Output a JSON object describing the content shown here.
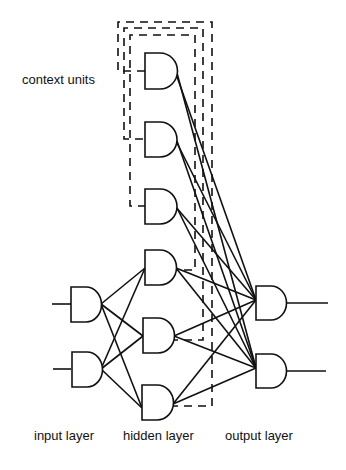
{
  "labels": {
    "context": "context units",
    "input": "input layer",
    "hidden": "hidden layer",
    "output": "output layer"
  },
  "diagram": {
    "type": "recurrent neural network (Elman network)",
    "node_shape": "AND-gate glyph",
    "layers": {
      "input": {
        "count": 2
      },
      "hidden": {
        "count": 3
      },
      "context": {
        "count": 3
      },
      "output": {
        "count": 2
      }
    },
    "connections": {
      "input_to_hidden": "fully connected (solid)",
      "hidden_to_output": "fully connected (solid)",
      "context_to_output": "fully connected (solid)",
      "hidden_to_context": "one-to-one copy (dashed)"
    },
    "colors": {
      "stroke": "#111111",
      "background": "#ffffff"
    }
  }
}
